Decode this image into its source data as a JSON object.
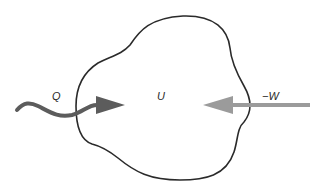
{
  "diagram": {
    "type": "thermodynamic-system",
    "system": {
      "label": "U",
      "outline_color": "#2a2a2a"
    },
    "heat_arrow": {
      "label": "Q",
      "style": "wavy",
      "direction": "into-system",
      "color": "#5c5c5c"
    },
    "work_arrow": {
      "label": "−W",
      "style": "straight",
      "direction": "into-system",
      "color": "#9b9b9b"
    }
  }
}
